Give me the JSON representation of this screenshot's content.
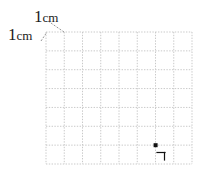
{
  "figure": {
    "type": "geometry-grid-diagram",
    "background_color": "#ffffff",
    "ink_color": "#1c1c1c",
    "grid_line_color": "#c9c9c9",
    "leader_line_color": "#8a8a8a"
  },
  "labels": {
    "top": {
      "number": "1",
      "unit": "cm",
      "full": "1cm"
    },
    "left": {
      "number": "1",
      "unit": "cm",
      "full": "1cm"
    }
  },
  "grid": {
    "columns": 8,
    "rows": 7,
    "cell_size_label": "1cm",
    "left_px": 46,
    "top_px": 32,
    "right_px": 192,
    "bottom_px": 164,
    "cell_width_px": 18.25,
    "cell_height_px": 18.857,
    "line_style": "dotted"
  },
  "point": {
    "label": "",
    "grid_column_index": 6,
    "grid_row_index": 6,
    "x_px": 155.5,
    "y_px": 145.1,
    "size_px": 4,
    "color": "#111111"
  },
  "right_angle_mark": {
    "description": "small right-angle corner bracket below-right of the point",
    "orientation": "top-right-corner",
    "color": "#111111",
    "arm_length_px": 8
  },
  "leaders": [
    {
      "name": "top-label-leader",
      "from_x": 48,
      "from_y": 21,
      "to_x": 64,
      "to_y": 32
    },
    {
      "name": "left-label-leader",
      "from_x": 41,
      "from_y": 41,
      "to_x": 46,
      "to_y": 32
    }
  ]
}
